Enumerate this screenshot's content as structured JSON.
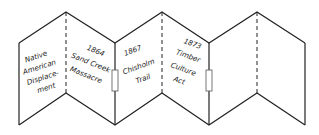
{
  "diagram": {
    "type": "accordion-foldable",
    "stroke_color": "#222222",
    "background": "#ffffff",
    "panels": [
      {
        "lines": [
          "Native",
          "American",
          "Displace-",
          "ment"
        ]
      },
      {
        "lines": [
          "1864",
          "Sand Creek",
          "Massacre"
        ]
      },
      {
        "lines": [
          "1867",
          "Chisholm",
          "Trail"
        ]
      },
      {
        "lines": [
          "1873",
          "Timber",
          "Culture",
          "Act"
        ]
      },
      {
        "lines": []
      },
      {
        "lines": []
      }
    ]
  }
}
